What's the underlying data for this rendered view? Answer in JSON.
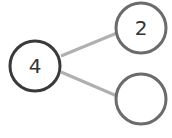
{
  "diagram": {
    "type": "number-bond",
    "whole": {
      "value": "4",
      "stroke": "#3a3a3a"
    },
    "parts": [
      {
        "value": "2",
        "stroke": "#6b6b6b"
      },
      {
        "value": "",
        "stroke": "#6b6b6b"
      }
    ],
    "connector_color": "#b0b0b0"
  }
}
